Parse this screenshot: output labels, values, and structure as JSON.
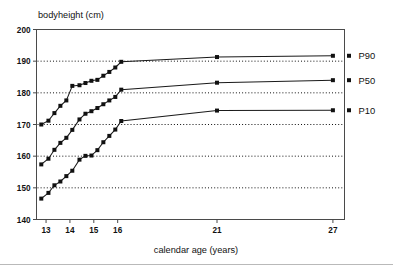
{
  "chart_data": {
    "type": "line",
    "title": "",
    "xlabel": "calendar age (years)",
    "ylabel": "bodyheight (cm)",
    "xlim": [
      12.6,
      27.6
    ],
    "ylim": [
      140,
      200
    ],
    "xticks": [
      13,
      14,
      15,
      16,
      21,
      27
    ],
    "xtick_labels": [
      "13",
      "14",
      "15",
      "16",
      "21",
      "27"
    ],
    "yticks": [
      140,
      150,
      160,
      170,
      180,
      190,
      200
    ],
    "ytick_labels": [
      "140",
      "150",
      "160",
      "170",
      "180",
      "190",
      "200"
    ],
    "grid": "horizontal-dotted",
    "gridlines_y": [
      150,
      160,
      170,
      180,
      190
    ],
    "legend_position": "right-of-plot",
    "marker": "filled-square",
    "series": [
      {
        "name": "P90",
        "label": "P90",
        "color": "#111111",
        "x": [
          12.8,
          13.1,
          13.35,
          13.6,
          13.85,
          14.1,
          14.4,
          14.65,
          14.9,
          15.15,
          15.4,
          15.65,
          15.9,
          16.15,
          21.0,
          27.0
        ],
        "y": [
          170.0,
          171.2,
          173.6,
          175.9,
          177.6,
          182.2,
          182.4,
          183.1,
          183.8,
          184.1,
          185.4,
          186.6,
          188.0,
          189.8,
          191.3,
          191.7
        ]
      },
      {
        "name": "P50",
        "label": "P50",
        "color": "#111111",
        "x": [
          12.8,
          13.1,
          13.35,
          13.6,
          13.85,
          14.1,
          14.4,
          14.65,
          14.9,
          15.15,
          15.4,
          15.65,
          15.9,
          16.15,
          21.0,
          27.0
        ],
        "y": [
          157.4,
          159.2,
          162.0,
          164.2,
          165.8,
          168.3,
          171.6,
          173.4,
          174.2,
          175.2,
          176.4,
          177.6,
          178.7,
          181.0,
          183.2,
          184.0
        ]
      },
      {
        "name": "P10",
        "label": "P10",
        "color": "#111111",
        "x": [
          12.8,
          13.1,
          13.35,
          13.6,
          13.85,
          14.1,
          14.4,
          14.65,
          14.9,
          15.15,
          15.4,
          15.65,
          15.9,
          16.15,
          21.0,
          27.0
        ],
        "y": [
          146.6,
          148.4,
          150.8,
          152.0,
          153.7,
          155.4,
          158.9,
          160.1,
          160.2,
          161.9,
          164.4,
          166.4,
          168.4,
          171.1,
          174.4,
          174.5
        ]
      }
    ]
  },
  "labels": {
    "y_axis_title": "bodyheight  (cm)",
    "x_axis_title": "calendar age (years)",
    "p90": "P90",
    "p50": "P50",
    "p10": "P10"
  }
}
